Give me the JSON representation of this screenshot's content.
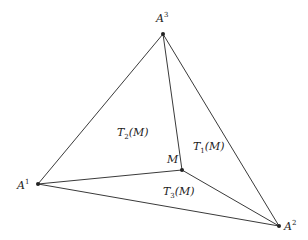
{
  "diagram": {
    "type": "triangle-subdivision",
    "vertices": {
      "A1": {
        "name": "A",
        "index": "1",
        "x": 38,
        "y": 184
      },
      "A2": {
        "name": "A",
        "index": "2",
        "x": 279,
        "y": 226
      },
      "A3": {
        "name": "A",
        "index": "3",
        "x": 163,
        "y": 34
      },
      "M": {
        "name": "M",
        "x": 182,
        "y": 170
      }
    },
    "regions": [
      {
        "id": "T1",
        "base": "T",
        "index": "1",
        "arg": "(M)"
      },
      {
        "id": "T2",
        "base": "T",
        "index": "2",
        "arg": "(M)"
      },
      {
        "id": "T3",
        "base": "T",
        "index": "3",
        "arg": "(M)"
      }
    ],
    "point_label": "M"
  }
}
